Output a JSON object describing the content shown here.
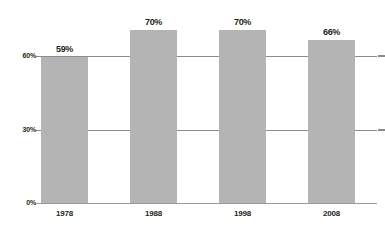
{
  "chart_data": {
    "type": "bar",
    "title": "",
    "subtitle": "",
    "xlabel": "",
    "ylabel": "",
    "categories": [
      "1978",
      "1988",
      "1998",
      "2008"
    ],
    "values": [
      59,
      70,
      70,
      66
    ],
    "value_labels": [
      "59%",
      "70%",
      "70%",
      "66%"
    ],
    "ylim": [
      0,
      75
    ],
    "yticks": [
      0,
      30,
      60
    ],
    "ytick_labels": [
      "0%",
      "30%",
      "60%"
    ],
    "grid": true,
    "gridlines_at": [
      30,
      60
    ],
    "legend": null,
    "series": [
      {
        "name": "",
        "values": [
          59,
          70,
          70,
          66
        ]
      }
    ],
    "colors": {
      "bar_fill": "#b4b4b4",
      "gridline": "#8c8c8c",
      "axis": "#9a9a9a",
      "text": "#231f20",
      "background": "#ffffff"
    }
  }
}
